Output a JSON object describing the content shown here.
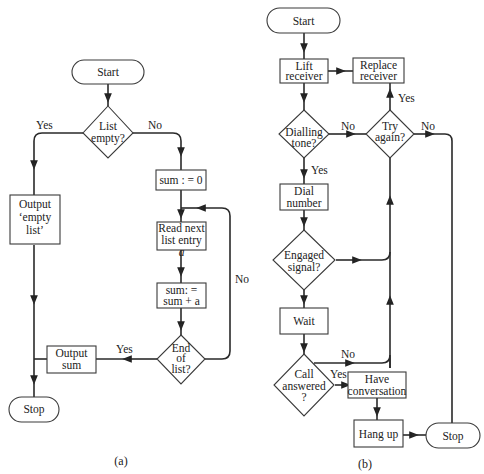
{
  "figure_a": {
    "caption": "(a)",
    "nodes": {
      "start": "Start",
      "list_empty": [
        "List",
        "empty?"
      ],
      "output_empty": [
        "Output",
        "‘empty",
        "list’"
      ],
      "sum_init": "sum : = 0",
      "read_next": [
        "Read next",
        "list entry",
        "a"
      ],
      "sum_add": [
        "sum: =",
        "sum + a"
      ],
      "end_of_list": [
        "End",
        "of",
        "list?"
      ],
      "output_sum": [
        "Output",
        "sum"
      ],
      "stop": "Stop"
    },
    "edges": {
      "list_empty_yes": "Yes",
      "list_empty_no": "No",
      "end_yes": "Yes",
      "end_no": "No"
    }
  },
  "figure_b": {
    "caption": "(b)",
    "nodes": {
      "start": "Start",
      "lift_receiver": [
        "Lift",
        "receiver"
      ],
      "replace_receiver": [
        "Replace",
        "receiver"
      ],
      "dialling_tone": [
        "Dialling",
        "tone?"
      ],
      "try_again": [
        "Try",
        "again?"
      ],
      "dial_number": [
        "Dial",
        "number"
      ],
      "engaged_signal": [
        "Engaged",
        "signal?"
      ],
      "wait": "Wait",
      "call_answered": [
        "Call",
        "answered",
        "?"
      ],
      "have_conversation": [
        "Have",
        "conversation"
      ],
      "hang_up": "Hang up",
      "stop": "Stop"
    },
    "edges": {
      "dialling_no": "No",
      "dialling_yes": "Yes",
      "try_yes": "Yes",
      "try_no": "No",
      "call_no": "No",
      "call_yes": "Yes"
    }
  }
}
